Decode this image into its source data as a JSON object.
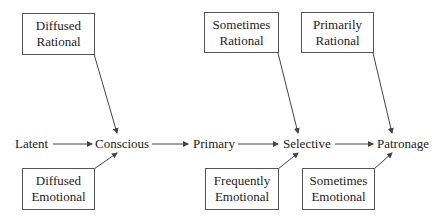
{
  "diagram": {
    "stages": [
      {
        "id": "latent",
        "label": "Latent"
      },
      {
        "id": "conscious",
        "label": "Conscious"
      },
      {
        "id": "primary",
        "label": "Primary"
      },
      {
        "id": "selective",
        "label": "Selective"
      },
      {
        "id": "patronage",
        "label": "Patronage"
      }
    ],
    "influences": {
      "diffused_rational": {
        "line1": "Diffused",
        "line2": "Rational",
        "target": "conscious"
      },
      "diffused_emotional": {
        "line1": "Diffused",
        "line2": "Emotional",
        "target": "conscious"
      },
      "sometimes_rational": {
        "line1": "Sometimes",
        "line2": "Rational",
        "target": "selective"
      },
      "frequently_emotional": {
        "line1": "Frequently",
        "line2": "Emotional",
        "target": "selective"
      },
      "primarily_rational": {
        "line1": "Primarily",
        "line2": "Rational",
        "target": "patronage"
      },
      "sometimes_emotional": {
        "line1": "Sometimes",
        "line2": "Emotional",
        "target": "patronage"
      }
    },
    "colors": {
      "line": "#444444",
      "text": "#222222",
      "background": "#ffffff"
    }
  }
}
